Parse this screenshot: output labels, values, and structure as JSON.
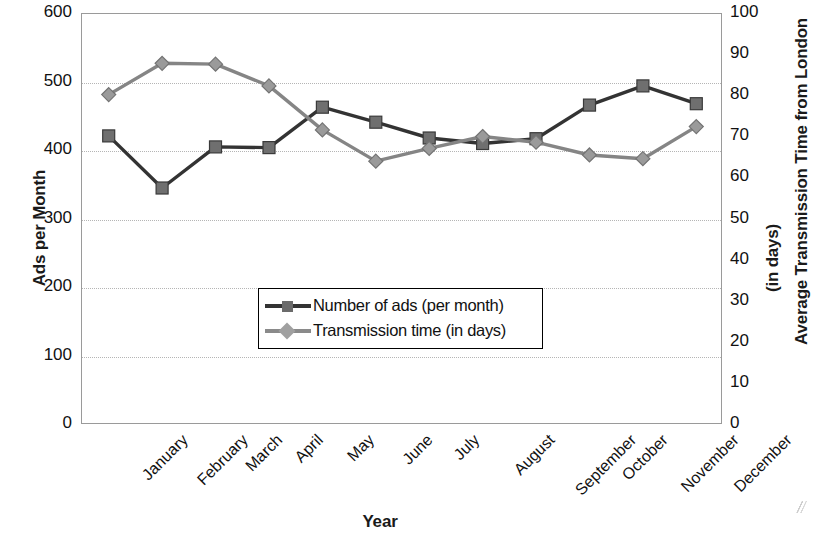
{
  "chart_data": {
    "type": "line",
    "title": "",
    "xlabel": "Year",
    "categories": [
      "January",
      "February",
      "March",
      "April",
      "May",
      "June",
      "July",
      "August",
      "September",
      "October",
      "November",
      "December"
    ],
    "grid": true,
    "legend_position": "center",
    "axes": {
      "left": {
        "label": "Ads per Month",
        "ylim": [
          0,
          600
        ],
        "ticks": [
          0,
          100,
          200,
          300,
          400,
          500,
          600
        ],
        "tick_labels": [
          "0",
          "100",
          "200",
          "300",
          "400",
          "500",
          "600"
        ]
      },
      "right": {
        "label_line1": "Average Transmission Time from London",
        "label_line2": "(in days)",
        "ylim": [
          0,
          100
        ],
        "ticks": [
          0,
          10,
          20,
          30,
          40,
          50,
          60,
          70,
          80,
          90,
          100
        ],
        "tick_labels": [
          "0",
          "10",
          "20",
          "30",
          "40",
          "50",
          "60",
          "70",
          "80",
          "90",
          "100"
        ]
      }
    },
    "series": [
      {
        "name": "Number of ads (per month)",
        "axis": "left",
        "marker": "square",
        "color": "#333333",
        "values": [
          422,
          346,
          406,
          405,
          464,
          442,
          419,
          411,
          418,
          467,
          495,
          469
        ]
      },
      {
        "name": "Transmission time (in days)",
        "axis": "right",
        "marker": "diamond",
        "color": "#858585",
        "values": [
          80.4,
          88.0,
          87.8,
          82.5,
          71.8,
          64.2,
          67.3,
          70.2,
          68.8,
          65.7,
          64.8,
          72.6
        ]
      }
    ]
  },
  "legend": {
    "items": [
      {
        "label": "Number of ads (per month)"
      },
      {
        "label": "Transmission time (in days)"
      }
    ]
  },
  "colors": {
    "series_ads": "#333333",
    "series_transmission": "#858585",
    "grid": "#b5b5b5",
    "frame": "#9a9a9a",
    "text": "#111111"
  }
}
